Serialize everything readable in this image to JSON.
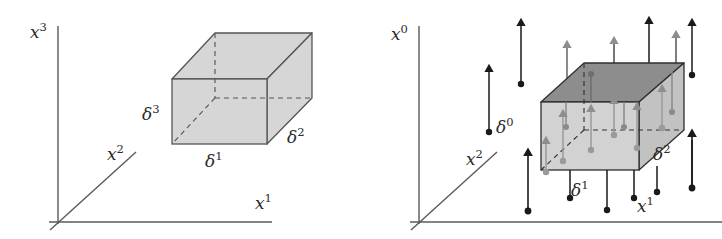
{
  "figure": {
    "title": "",
    "background_color": "#ffffff",
    "width": 722,
    "height": 239,
    "panels": [
      {
        "id": "left-panel",
        "name": "scalar-cell-diagram",
        "axes": [
          {
            "name": "vertical-axis",
            "label_base": "x",
            "label_sup": "3",
            "label_x": 30,
            "label_y": 38
          },
          {
            "name": "diagonal-axis",
            "label_base": "x",
            "label_sup": "2",
            "label_x": 107,
            "label_y": 160
          },
          {
            "name": "horizontal-axis",
            "label_base": "x",
            "label_sup": "1",
            "label_x": 255,
            "label_y": 209
          }
        ],
        "cell_labels": [
          {
            "name": "delta3-label",
            "label_base": "δ",
            "label_sup": "3",
            "label_x": 143,
            "label_y": 120
          },
          {
            "name": "delta1-label",
            "label_base": "δ",
            "label_sup": "1",
            "label_x": 207,
            "label_y": 167
          },
          {
            "name": "delta2-label",
            "label_base": "δ",
            "label_sup": "2",
            "label_x": 288,
            "label_y": 143
          }
        ],
        "cell_fill": "#d6d6d6",
        "cell_top_fill": "#d6d6d6",
        "cell_side_fill": "#d6d6d6",
        "cell_stroke": "#555555",
        "arrows": []
      },
      {
        "id": "right-panel",
        "name": "vector-cell-diagram",
        "axes": [
          {
            "name": "vertical-axis",
            "label_base": "x",
            "label_sup": "0",
            "label_x": 392,
            "label_y": 40
          },
          {
            "name": "diagonal-axis",
            "label_base": "x",
            "label_sup": "2",
            "label_x": 466,
            "label_y": 165
          },
          {
            "name": "horizontal-axis",
            "label_base": "x",
            "label_sup": "1",
            "label_x": 639,
            "label_y": 212
          }
        ],
        "cell_labels": [
          {
            "name": "delta0-label",
            "label_base": "δ",
            "label_sup": "0",
            "label_x": 497,
            "label_y": 133
          },
          {
            "name": "delta1-label",
            "label_base": "δ",
            "label_sup": "1",
            "label_x": 573,
            "label_y": 196
          },
          {
            "name": "delta2-label",
            "label_base": "δ",
            "label_sup": "2",
            "label_x": 654,
            "label_y": 160
          }
        ],
        "cell_fill": "#d2d2d2",
        "cell_top_fill": "#8d8d8d",
        "cell_side_fill": "#bfbfbf",
        "cell_stroke": "#3a3a3a",
        "arrow_color_outer": "#1a1a1a",
        "arrow_color_inner": "#8e8e8e",
        "arrow_count_outer": 12,
        "arrow_count_inner": 14
      }
    ]
  }
}
